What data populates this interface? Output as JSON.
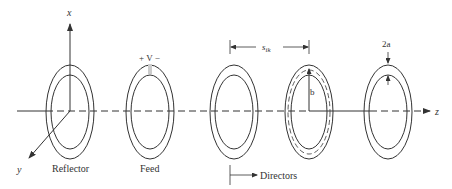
{
  "diagram": {
    "type": "yagi-uda loop antenna array",
    "axes": {
      "x": "x",
      "y": "y",
      "z": "z"
    },
    "labels": {
      "reflector": "Reflector",
      "feed": "Feed",
      "feed_voltage": "+ V −",
      "directors": "Directors",
      "spacing": "s",
      "spacing_sub": "ik",
      "radius": "b",
      "thickness": "2a"
    },
    "elements": [
      {
        "name": "reflector",
        "cx": 70
      },
      {
        "name": "feed",
        "cx": 150
      },
      {
        "name": "director-1",
        "cx": 234
      },
      {
        "name": "director-2",
        "cx": 309
      },
      {
        "name": "director-3",
        "cx": 388
      }
    ],
    "colors": {
      "stroke": "#333333",
      "background": "#ffffff"
    }
  }
}
